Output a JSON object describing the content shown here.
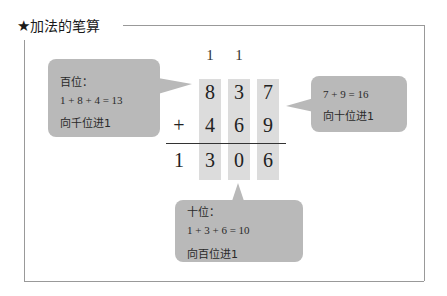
{
  "title": {
    "icon": "★",
    "text": "加法的笔算"
  },
  "calculation": {
    "carries": [
      "1",
      "1"
    ],
    "row1": [
      "8",
      "3",
      "7"
    ],
    "operator": "+",
    "row2": [
      "4",
      "6",
      "9"
    ],
    "result": [
      "1",
      "3",
      "0",
      "6"
    ]
  },
  "bubbles": {
    "hundreds": {
      "label": "百位：",
      "equation": "1 + 8 + 4 = 13",
      "note": "向千位进1"
    },
    "ones": {
      "equation": "7 + 9 = 16",
      "note": "向十位进1"
    },
    "tens": {
      "label": "十位：",
      "equation": "1 + 3 + 6 = 10",
      "note": "向百位进1"
    }
  },
  "colors": {
    "column_bg": "#dcdcdc",
    "bubble_bg": "#b9b9b9",
    "frame": "#999999"
  }
}
